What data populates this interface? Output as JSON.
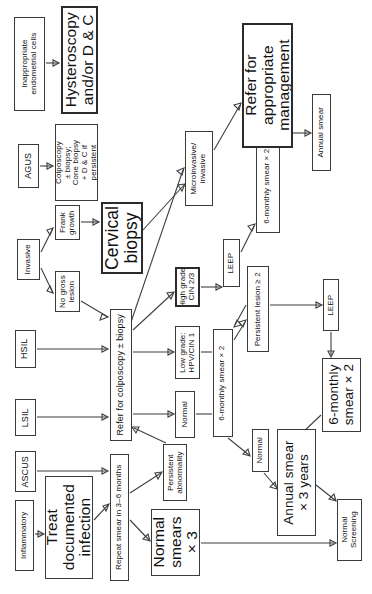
{
  "diagram": {
    "orientation": "text rotated 90 degrees counter-clockwise (sideways page)",
    "line_color": "#3f3f3f",
    "box_border_color": "#3a3a3a",
    "background": "#ffffff"
  },
  "nodes": [
    {
      "id": "inappropriate_endometrial",
      "label": "Inappropriate\nendometrial cells",
      "x": 14,
      "y": 17,
      "w": 31,
      "h": 94,
      "size": "s8",
      "thick": false
    },
    {
      "id": "hysteroscopy_dc",
      "label": "Hysteroscopy\nand/or D & C",
      "x": 61,
      "y": 6,
      "w": 37,
      "h": 108,
      "size": "s15",
      "thick": true
    },
    {
      "id": "agus",
      "label": "AGUS",
      "x": 18,
      "y": 144,
      "w": 21,
      "h": 44,
      "size": "s9",
      "thick": false
    },
    {
      "id": "colposcopy_cone",
      "label": "Colposcopy\n± biopsy;\nCone biopsy\n+ D & C if\npersistent",
      "x": 55,
      "y": 124,
      "w": 43,
      "h": 77,
      "size": "s8",
      "thick": false
    },
    {
      "id": "invasive",
      "label": "Invasive",
      "x": 17,
      "y": 239,
      "w": 23,
      "h": 41,
      "size": "s8",
      "thick": false
    },
    {
      "id": "frank_growth",
      "label": "Frank\ngrowth",
      "x": 55,
      "y": 205,
      "w": 25,
      "h": 35,
      "size": "s8",
      "thick": false
    },
    {
      "id": "no_gross_lesion",
      "label": "No gross\nlesion",
      "x": 55,
      "y": 271,
      "w": 25,
      "h": 41,
      "size": "s8",
      "thick": false
    },
    {
      "id": "cervical_biopsy",
      "label": "Cervical\nbiopsy",
      "x": 101,
      "y": 202,
      "w": 42,
      "h": 72,
      "size": "s17",
      "thick": true
    },
    {
      "id": "hsil",
      "label": "HSIL",
      "x": 15,
      "y": 330,
      "w": 21,
      "h": 38,
      "size": "s9",
      "thick": false
    },
    {
      "id": "lsil",
      "label": "LSIL",
      "x": 15,
      "y": 399,
      "w": 21,
      "h": 37,
      "size": "s9",
      "thick": false
    },
    {
      "id": "ascus",
      "label": "ASCUS",
      "x": 15,
      "y": 451,
      "w": 21,
      "h": 41,
      "size": "s9",
      "thick": false
    },
    {
      "id": "inflammatory",
      "label": "Inflammatory",
      "x": 15,
      "y": 500,
      "w": 19,
      "h": 71,
      "size": "s8",
      "thick": false
    },
    {
      "id": "refer_colposcopy",
      "label": "Refer for colposcopy ± biopsy",
      "x": 110,
      "y": 309,
      "w": 22,
      "h": 132,
      "size": "s9",
      "thick": false
    },
    {
      "id": "treat_documented_infection",
      "label": "Treat\ndocumented\ninfection",
      "x": 45,
      "y": 476,
      "w": 48,
      "h": 103,
      "size": "s15",
      "thick": false
    },
    {
      "id": "repeat_smear_3_6",
      "label": "Repeat smear in 3–6 months",
      "x": 110,
      "y": 454,
      "w": 19,
      "h": 127,
      "size": "s8",
      "thick": false
    },
    {
      "id": "microinvasive",
      "label": "Microinvasive/\ninvasive",
      "x": 185,
      "y": 131,
      "w": 28,
      "h": 75,
      "size": "s8",
      "thick": false
    },
    {
      "id": "high_grade",
      "label": "High grade:\nCIN 2/3",
      "x": 175,
      "y": 267,
      "w": 25,
      "h": 40,
      "size": "s8",
      "thick": true
    },
    {
      "id": "low_grade",
      "label": "Low grade:\nHPV/CIN 1",
      "x": 175,
      "y": 326,
      "w": 25,
      "h": 53,
      "size": "s8",
      "thick": false
    },
    {
      "id": "normal_path",
      "label": "Normal",
      "x": 175,
      "y": 391,
      "w": 20,
      "h": 47,
      "size": "s8",
      "thick": false
    },
    {
      "id": "persistent_abnormality",
      "label": "Persistent\nabnormality",
      "x": 163,
      "y": 444,
      "w": 24,
      "h": 57,
      "size": "s8",
      "thick": false
    },
    {
      "id": "normal_smears_x3",
      "label": "Normal\nsmears\n× 3",
      "x": 151,
      "y": 509,
      "w": 49,
      "h": 67,
      "size": "s15",
      "thick": false
    },
    {
      "id": "leep_upper",
      "label": "LEEP",
      "x": 223,
      "y": 239,
      "w": 17,
      "h": 48,
      "size": "s8",
      "thick": false
    },
    {
      "id": "six_monthly_smear_x2_mid",
      "label": "6-monthly smear × 2",
      "x": 213,
      "y": 329,
      "w": 20,
      "h": 108,
      "size": "s8",
      "thick": false
    },
    {
      "id": "persistent_lesion",
      "label": "Persistent lesion ≥ 2",
      "x": 247,
      "y": 266,
      "w": 22,
      "h": 86,
      "size": "s8",
      "thick": false
    },
    {
      "id": "six_monthly_smear_x2_top",
      "label": "6-monthly smear × 2",
      "x": 256,
      "y": 139,
      "w": 24,
      "h": 94,
      "size": "s8",
      "thick": false
    },
    {
      "id": "refer_appropriate_management",
      "label": "Refer for\nappropriate\nmanagement",
      "x": 242,
      "y": 23,
      "w": 51,
      "h": 125,
      "size": "s15",
      "thick": true
    },
    {
      "id": "annual_smear",
      "label": "Annual smear",
      "x": 312,
      "y": 94,
      "w": 19,
      "h": 77,
      "size": "s8",
      "thick": false
    },
    {
      "id": "normal_small",
      "label": "Normal",
      "x": 252,
      "y": 429,
      "w": 17,
      "h": 43,
      "size": "s8",
      "thick": false
    },
    {
      "id": "leep_lower",
      "label": "LEEP",
      "x": 323,
      "y": 279,
      "w": 16,
      "h": 52,
      "size": "s8",
      "thick": false
    },
    {
      "id": "six_monthly_smear_x2_big",
      "label": "6-monthly\nsmear × 2",
      "x": 322,
      "y": 358,
      "w": 39,
      "h": 74,
      "size": "s13",
      "thick": false
    },
    {
      "id": "annual_smear_3_years",
      "label": "Annual smear\n× 3 years",
      "x": 277,
      "y": 429,
      "w": 39,
      "h": 107,
      "size": "s13",
      "thick": false
    },
    {
      "id": "normal_screening",
      "label": "Normal\nScreening",
      "x": 337,
      "y": 499,
      "w": 25,
      "h": 62,
      "size": "s8",
      "thick": false
    }
  ],
  "edges": [
    {
      "from": "inappropriate_endometrial",
      "to": "hysteroscopy_dc",
      "kind": "arrow"
    },
    {
      "from": "agus",
      "to": "colposcopy_cone",
      "kind": "arrow"
    },
    {
      "from": "invasive",
      "to": "frank_growth",
      "kind": "arrow"
    },
    {
      "from": "invasive",
      "to": "no_gross_lesion",
      "kind": "arrow"
    },
    {
      "from": "frank_growth",
      "to": "cervical_biopsy",
      "kind": "arrow"
    },
    {
      "from": "no_gross_lesion",
      "to": "refer_colposcopy",
      "kind": "arrow"
    },
    {
      "from": "hsil",
      "to": "refer_colposcopy",
      "kind": "arrow"
    },
    {
      "from": "lsil",
      "to": "refer_colposcopy",
      "kind": "arrow"
    },
    {
      "from": "ascus",
      "to": "repeat_smear_3_6",
      "kind": "arrow"
    },
    {
      "from": "inflammatory",
      "to": "treat_documented_infection",
      "kind": "arrow"
    },
    {
      "from": "treat_documented_infection",
      "to": "repeat_smear_3_6",
      "kind": "arrow"
    },
    {
      "from": "repeat_smear_3_6",
      "to": "persistent_abnormality",
      "kind": "arrow"
    },
    {
      "from": "repeat_smear_3_6",
      "to": "normal_smears_x3",
      "kind": "arrow"
    },
    {
      "from": "persistent_abnormality",
      "to": "refer_colposcopy",
      "kind": "arrow"
    },
    {
      "from": "cervical_biopsy",
      "to": "microinvasive",
      "kind": "arrow"
    },
    {
      "from": "refer_colposcopy",
      "to": "microinvasive",
      "kind": "arrow"
    },
    {
      "from": "refer_colposcopy",
      "to": "high_grade",
      "kind": "arrow"
    },
    {
      "from": "refer_colposcopy",
      "to": "low_grade",
      "kind": "arrow"
    },
    {
      "from": "refer_colposcopy",
      "to": "normal_path",
      "kind": "arrow"
    },
    {
      "from": "microinvasive",
      "to": "refer_appropriate_management",
      "kind": "arrow"
    },
    {
      "from": "high_grade",
      "to": "leep_upper",
      "kind": "arrow"
    },
    {
      "from": "leep_upper",
      "to": "six_monthly_smear_x2_top",
      "kind": "arrow"
    },
    {
      "from": "six_monthly_smear_x2_top",
      "to": "annual_smear",
      "kind": "arrow"
    },
    {
      "from": "low_grade",
      "to": "six_monthly_smear_x2_mid",
      "kind": "tick"
    },
    {
      "from": "normal_path",
      "to": "six_monthly_smear_x2_mid",
      "kind": "tick"
    },
    {
      "from": "six_monthly_smear_x2_mid",
      "to": "persistent_lesion",
      "kind": "arrow"
    },
    {
      "from": "persistent_lesion",
      "to": "six_monthly_smear_x2_mid",
      "kind": "arrow"
    },
    {
      "from": "persistent_lesion",
      "to": "leep_lower",
      "kind": "arrow"
    },
    {
      "from": "leep_lower",
      "to": "six_monthly_smear_x2_big",
      "kind": "arrow"
    },
    {
      "from": "six_monthly_smear_x2_mid",
      "to": "normal_small",
      "kind": "arrow"
    },
    {
      "from": "normal_small",
      "to": "annual_smear_3_years",
      "kind": "arrow"
    },
    {
      "from": "six_monthly_smear_x2_big",
      "to": "annual_smear_3_years",
      "kind": "arrow"
    },
    {
      "from": "annual_smear_3_years",
      "to": "normal_screening",
      "kind": "arrow"
    },
    {
      "from": "normal_smears_x3",
      "to": "normal_screening",
      "kind": "arrow"
    }
  ],
  "wires": [
    {
      "name": "inappropriate-to-hysteroscopy",
      "d": "M46,63 L59,63",
      "arrow": "M59,63 L53,60 L53,66 Z"
    },
    {
      "name": "agus-to-colposcopy",
      "d": "M40,166 L53,166",
      "arrow": "M53,166 L47,163 L47,169 Z"
    },
    {
      "name": "invasive-to-frank",
      "d": "M41,252 L53,228",
      "arrow": "M53,228 L47,230 L50,235 Z"
    },
    {
      "name": "invasive-to-nogross",
      "d": "M41,268 L53,293",
      "arrow": "M53,293 L50,286 L47,291 Z"
    },
    {
      "name": "frank-to-cervicalbiopsy",
      "d": "M81,222 L99,222",
      "arrow": "M99,222 L93,219 L93,225 Z"
    },
    {
      "name": "nogross-to-refer",
      "d": "M81,301 L108,317",
      "arrow": "M108,317 L102,314 L100,320 Z"
    },
    {
      "name": "hsil-to-refer",
      "d": "M37,349 L107,349",
      "arrow": "M108,349 L102,346 L102,352 Z"
    },
    {
      "name": "lsil-to-refer",
      "d": "M37,417 L107,417",
      "arrow": "M108,417 L102,414 L102,420 Z"
    },
    {
      "name": "ascus-to-repeat",
      "d": "M37,471 L107,471",
      "arrow": "M108,471 L102,468 L102,474 Z"
    },
    {
      "name": "inflammatory-to-treat",
      "d": "M35,534 L43,534",
      "arrow": "M44,534 L38,531 L38,537 Z"
    },
    {
      "name": "treat-to-repeat",
      "d": "M94,520 L108,505",
      "arrow": "M109,504 L103,506 L106,511 Z"
    },
    {
      "name": "repeat-to-persistent",
      "d": "M130,493 L161,473",
      "arrow": "M162,472 L155,473 L158,479 Z"
    },
    {
      "name": "repeat-to-normalsmears",
      "d": "M130,520 L149,540",
      "arrow": "M150,541 L148,534 L143,539 Z"
    },
    {
      "name": "persistent-to-refer",
      "d": "M166,443 L134,428",
      "arrow": "M132,427 L139,427 L136,433 Z"
    },
    {
      "name": "cervicalbiopsy-to-micro",
      "d": "M143,230 L184,185",
      "arrow": "M185,184 L178,185 L182,191 Z"
    },
    {
      "name": "refer-to-micro",
      "d": "M131,322 L183,170",
      "arrow": "M184,168 L177,171 L182,175 Z"
    },
    {
      "name": "refer-to-highgrade",
      "d": "M133,330 L173,293",
      "arrow": "M174,292 L167,293 L171,299 Z"
    },
    {
      "name": "refer-to-lowgrade",
      "d": "M133,352 L173,352",
      "arrow": "M174,352 L168,349 L168,355 Z"
    },
    {
      "name": "refer-to-normal",
      "d": "M133,414 L173,414",
      "arrow": "M174,414 L168,411 L168,417 Z"
    },
    {
      "name": "micro-to-refermanagement",
      "d": "M214,150 L240,105",
      "arrow": "M241,103 L234,105 L239,110 Z"
    },
    {
      "name": "highgrade-to-leep",
      "d": "M201,287 L221,287",
      "arrow": "M222,287 L216,284 L216,290 Z"
    },
    {
      "name": "leep-to-sixmonthlytop",
      "d": "M241,252 L254,226",
      "arrow": "M255,224 L248,226 L252,231 Z"
    },
    {
      "name": "sixmonthlytop-to-annual",
      "d": "M281,133 L310,133",
      "arrow": "M311,133 L305,130 L305,136 Z"
    },
    {
      "name": "lowgrade-tick",
      "d": "M201,352 L212,352"
    },
    {
      "name": "normal-tick",
      "d": "M196,414 L212,414"
    },
    {
      "name": "sixmonthlymid-to-persistentlesion",
      "d": "M234,340 L245,322",
      "arrow": "M246,320 L239,322 L243,327 Z"
    },
    {
      "name": "persistentlesion-to-sixmonthlymid",
      "d": "M246,305 L235,325",
      "arrow": "M234,327 L241,325 L237,320 Z"
    },
    {
      "name": "persistentlesion-to-leeplower",
      "d": "M270,305 L321,305",
      "arrow": "M322,305 L316,302 L316,308 Z"
    },
    {
      "name": "leeplower-to-sixmonthlybig",
      "d": "M331,332 L331,355",
      "arrow": "M331,357 L328,351 L334,351 Z"
    },
    {
      "name": "sixmonthlymid-to-normalsmall",
      "d": "M228,438 L249,455",
      "arrow": "M250,456 L248,449 L243,454 Z"
    },
    {
      "name": "normalsmall-to-annual3",
      "d": "M264,473 L276,487",
      "arrow": "M277,489 L275,482 L270,487 Z"
    },
    {
      "name": "sixmonthlybig-to-annual3",
      "d": "M321,415 L300,435",
      "arrow": "M298,437 L305,435 L301,430 Z"
    },
    {
      "name": "annual3-to-normalscreening",
      "d": "M311,481 L335,500",
      "arrow": "M336,501 L334,494 L329,499 Z"
    },
    {
      "name": "normalsmears-to-normalscreening",
      "d": "M201,543 L334,543",
      "arrow": "M336,543 L330,540 L330,546 Z"
    }
  ]
}
